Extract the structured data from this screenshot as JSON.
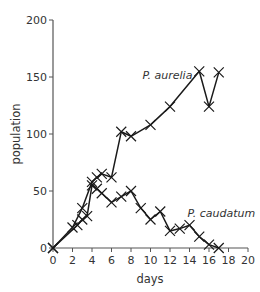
{
  "chart_data": {
    "type": "line",
    "title": "",
    "xlabel": "days",
    "ylabel": "population",
    "xlim": [
      0,
      20
    ],
    "ylim": [
      0,
      200
    ],
    "x_ticks": [
      0,
      2,
      4,
      6,
      8,
      10,
      12,
      14,
      16,
      18,
      20
    ],
    "y_ticks": [
      0,
      50,
      100,
      150,
      200
    ],
    "grid": false,
    "legend": "inline labels",
    "marker": "x",
    "series": [
      {
        "name": "P. aurelia",
        "label_position": {
          "x": 14.3,
          "y": 148
        },
        "points": [
          [
            0,
            0
          ],
          [
            2,
            18
          ],
          [
            3,
            35
          ],
          [
            4,
            58
          ],
          [
            4.5,
            62
          ],
          [
            5,
            65
          ],
          [
            6,
            62
          ],
          [
            7,
            102
          ],
          [
            8,
            98
          ],
          [
            10,
            108
          ],
          [
            12,
            124
          ],
          [
            15,
            155
          ],
          [
            16,
            124
          ],
          [
            17,
            154
          ]
        ]
      },
      {
        "name": "P. caudatum",
        "label_position": {
          "x": 13.8,
          "y": 27
        },
        "points": [
          [
            0,
            0
          ],
          [
            2.5,
            20
          ],
          [
            3,
            25
          ],
          [
            3.5,
            28
          ],
          [
            4,
            55
          ],
          [
            4.5,
            52
          ],
          [
            5,
            48
          ],
          [
            6,
            40
          ],
          [
            7,
            45
          ],
          [
            8,
            50
          ],
          [
            9,
            35
          ],
          [
            10,
            25
          ],
          [
            11,
            32
          ],
          [
            12,
            15
          ],
          [
            13,
            17
          ],
          [
            14,
            20
          ],
          [
            15,
            10
          ],
          [
            16,
            3
          ],
          [
            17,
            0
          ]
        ]
      }
    ]
  },
  "colors": {
    "axis": "#555555",
    "series": "#1a1a1a",
    "text": "#333333"
  }
}
